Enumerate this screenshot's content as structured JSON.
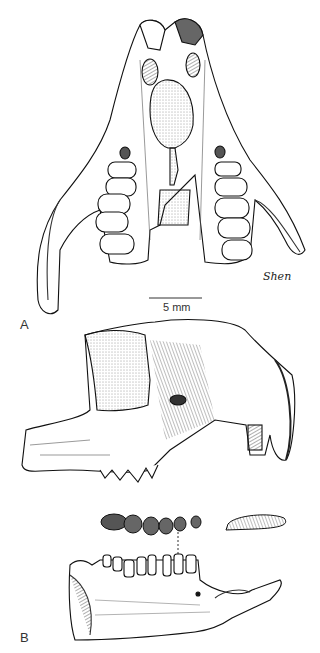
{
  "figure": {
    "panels": [
      {
        "label": "A",
        "description": "skull-ventral-view"
      },
      {
        "label": "B",
        "description": "skull-lateral-view-and-mandible"
      }
    ],
    "scale_bar": {
      "text": "5 mm"
    },
    "signature": "Shen"
  }
}
